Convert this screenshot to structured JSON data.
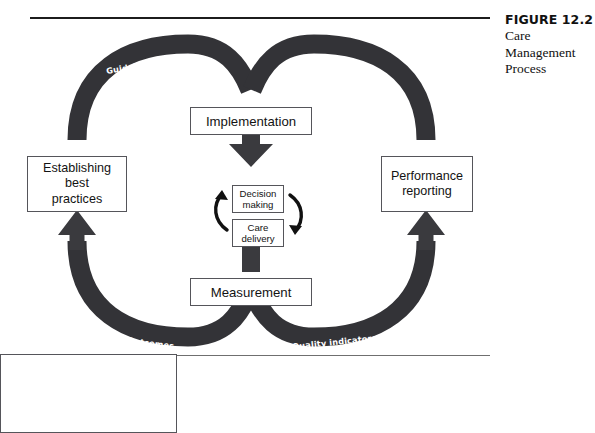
{
  "caption": {
    "figure_number": "FIGURE 12.2",
    "lines": [
      "Care",
      "Management",
      "Process"
    ]
  },
  "diagram": {
    "title": "Care Management Process",
    "colors": {
      "arc": "#333337",
      "arrow": "#3a3a3e",
      "box_border": "#55555a",
      "box_fill": "#ffffff",
      "text": "#131313",
      "arc_label_text": "#ffffff",
      "rule_top": "#1c1c1c",
      "rule_bottom": "#6f6f6f"
    },
    "nodes": {
      "establishing": "Establishing\nbest\npractices",
      "performance": "Performance\nreporting",
      "implementation": "Implementation",
      "measurement": "Measurement",
      "decision": "Decision\nmaking",
      "care": "Care\ndelivery"
    },
    "arc_labels": {
      "top_left": "Guidelines",
      "top_right": "Feedback",
      "bottom_left": "Outcomes",
      "bottom_right": "Quality indicators"
    },
    "flow": {
      "direction": "counterclockwise",
      "description": "Establishing best practices feeds Guidelines into Implementation; Implementation drives the Decision making / Care delivery cycle; Measurement produces Outcomes and Quality indicators which feed Performance reporting and Feedback."
    }
  }
}
